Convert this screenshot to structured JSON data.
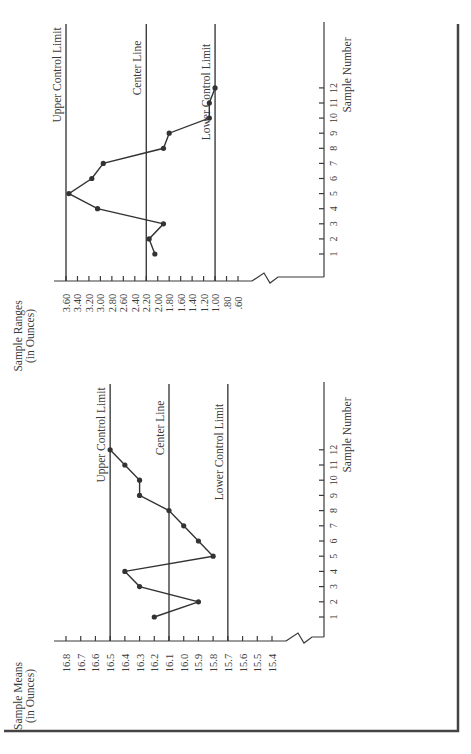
{
  "figure": {
    "orientation": "rotated-90-ccw",
    "frame_color": "#444444",
    "line_color": "#333333"
  },
  "chart_data": [
    {
      "type": "line",
      "title": "",
      "ylabel": "Sample Means (in Ounces)",
      "ylabel_lines": [
        "Sample Means",
        "(in Ounces)"
      ],
      "xlabel": "Sample Number",
      "x": [
        1,
        2,
        3,
        4,
        5,
        6,
        7,
        8,
        9,
        10,
        11,
        12
      ],
      "x_tick_labels": [
        "1",
        "2",
        "3",
        "4",
        "5",
        "6",
        "7",
        "8",
        "9",
        "10",
        "11",
        "12"
      ],
      "y_tick_labels": [
        "16.8",
        "16.7",
        "16.6",
        "16.5",
        "16.4",
        "16.3",
        "16.2",
        "16.1",
        "16.0",
        "15.9",
        "15.8",
        "15.7",
        "15.6",
        "15.5",
        "15.4"
      ],
      "ylim": [
        15.4,
        16.8
      ],
      "axis_break": true,
      "series": [
        {
          "name": "Sample Means",
          "values": [
            16.2,
            15.9,
            16.3,
            16.4,
            15.8,
            15.9,
            16.0,
            16.1,
            16.3,
            16.3,
            16.4,
            16.5
          ]
        }
      ],
      "reference_lines": [
        {
          "label": "Upper Control Limit",
          "value": 16.5
        },
        {
          "label": "Center Line",
          "value": 16.1
        },
        {
          "label": "Lower Control Limit",
          "value": 15.7
        }
      ],
      "grid": false,
      "legend": "none"
    },
    {
      "type": "line",
      "title": "",
      "ylabel": "Sample Ranges (in Ounces)",
      "ylabel_lines": [
        "Sample Ranges",
        "(in Ounces)"
      ],
      "xlabel": "Sample Number",
      "x": [
        1,
        2,
        3,
        4,
        5,
        6,
        7,
        8,
        9,
        10,
        11,
        12
      ],
      "x_tick_labels": [
        "1",
        "2",
        "3",
        "4",
        "5",
        "6",
        "7",
        "8",
        "9",
        "10",
        "11",
        "12"
      ],
      "y_tick_labels": [
        "3.60",
        "3.40",
        "3.20",
        "3.00",
        "2.80",
        "2.60",
        "2.40",
        "2.20",
        "2.00",
        "1.80",
        "1.60",
        "1.40",
        "1.20",
        "1.00",
        ".80",
        ".60"
      ],
      "ylim": [
        0.6,
        3.6
      ],
      "axis_break": true,
      "series": [
        {
          "name": "Sample Ranges",
          "values": [
            2.05,
            2.15,
            1.9,
            3.05,
            3.55,
            3.15,
            2.95,
            1.9,
            1.8,
            1.1,
            1.1,
            1.0
          ]
        }
      ],
      "reference_lines": [
        {
          "label": "Upper Control Limit",
          "value": 3.6
        },
        {
          "label": "Center Line",
          "value": 2.2
        },
        {
          "label": "Lower Control Limit",
          "value": 1.0
        }
      ],
      "grid": false,
      "legend": "none"
    }
  ]
}
